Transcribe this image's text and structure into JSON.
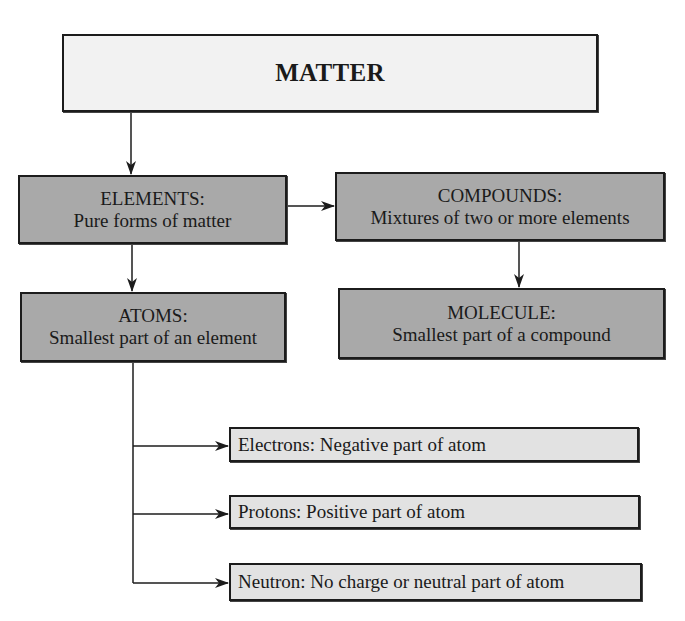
{
  "diagram": {
    "root": {
      "title": "MATTER"
    },
    "elements": {
      "heading": "ELEMENTS:",
      "description": "Pure forms of matter"
    },
    "compounds": {
      "heading": "COMPOUNDS:",
      "description": "Mixtures of two or more elements"
    },
    "atoms": {
      "heading": "ATOMS:",
      "description": "Smallest part of an element"
    },
    "molecule": {
      "heading": "MOLECULE:",
      "description": "Smallest part of a compound"
    },
    "particles": [
      {
        "label": "Electrons: Negative part of atom"
      },
      {
        "label": "Protons: Positive part of atom"
      },
      {
        "label": "Neutron: No charge or neutral part of atom"
      }
    ],
    "edges": [
      {
        "from": "MATTER",
        "to": "ELEMENTS"
      },
      {
        "from": "ELEMENTS",
        "to": "COMPOUNDS"
      },
      {
        "from": "ELEMENTS",
        "to": "ATOMS"
      },
      {
        "from": "COMPOUNDS",
        "to": "MOLECULE"
      },
      {
        "from": "ATOMS",
        "to": "Electrons"
      },
      {
        "from": "ATOMS",
        "to": "Protons"
      },
      {
        "from": "ATOMS",
        "to": "Neutron"
      }
    ],
    "colors": {
      "root_fill": "#f2f2f2",
      "main_fill": "#a9a9a9",
      "sub_fill": "#e2e2e2",
      "stroke": "#1c1c1c"
    }
  }
}
